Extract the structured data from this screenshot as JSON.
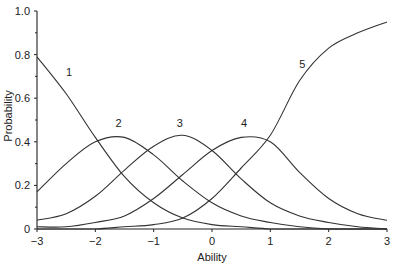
{
  "chart_data": {
    "type": "line",
    "title": "",
    "xlabel": "Ability",
    "ylabel": "Probability",
    "xlim": [
      -3,
      3
    ],
    "ylim": [
      0,
      1.0
    ],
    "grid": false,
    "legend": "none (curves labeled inline 1-5)",
    "x_ticks": [
      "-3",
      "-2",
      "-1",
      "0",
      "1",
      "2",
      "3"
    ],
    "y_ticks": [
      "0",
      "0.2",
      "0.4",
      "0.6",
      "0.8",
      "1.0"
    ],
    "x": [
      -3,
      -2.5,
      -2,
      -1.5,
      -1,
      -0.5,
      0,
      0.5,
      1,
      1.5,
      2,
      2.5,
      3
    ],
    "series": [
      {
        "name": "1",
        "values": [
          0.79,
          0.62,
          0.42,
          0.24,
          0.12,
          0.05,
          0.02,
          0.01,
          0.0,
          0.0,
          0.0,
          0.0,
          0.0
        ]
      },
      {
        "name": "2",
        "values": [
          0.17,
          0.3,
          0.4,
          0.42,
          0.34,
          0.22,
          0.12,
          0.06,
          0.03,
          0.01,
          0.0,
          0.0,
          0.0
        ]
      },
      {
        "name": "3",
        "values": [
          0.04,
          0.07,
          0.15,
          0.27,
          0.38,
          0.43,
          0.36,
          0.23,
          0.12,
          0.06,
          0.03,
          0.01,
          0.0
        ]
      },
      {
        "name": "4",
        "values": [
          0.01,
          0.01,
          0.03,
          0.06,
          0.14,
          0.25,
          0.36,
          0.42,
          0.4,
          0.26,
          0.14,
          0.07,
          0.04
        ]
      },
      {
        "name": "5",
        "values": [
          0.0,
          0.0,
          0.0,
          0.01,
          0.02,
          0.05,
          0.14,
          0.28,
          0.43,
          0.68,
          0.83,
          0.9,
          0.95
        ]
      }
    ],
    "annotations": [
      {
        "text": "1",
        "x": -2.45,
        "y": 0.7
      },
      {
        "text": "2",
        "x": -1.6,
        "y": 0.47
      },
      {
        "text": "3",
        "x": -0.55,
        "y": 0.47
      },
      {
        "text": "4",
        "x": 0.55,
        "y": 0.47
      },
      {
        "text": "5",
        "x": 1.55,
        "y": 0.74
      }
    ]
  }
}
